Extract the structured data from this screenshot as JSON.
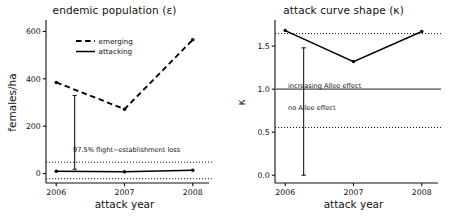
{
  "figure": {
    "panels": [
      {
        "id": "endemic-population",
        "title": "endemic population (ε)",
        "xlabel": "attack year",
        "ylabel": "females/ha"
      },
      {
        "id": "attack-curve-shape",
        "title": "attack curve shape (κ)",
        "xlabel": "attack year",
        "ylabel": "κ"
      }
    ]
  },
  "chart_data": [
    {
      "type": "line",
      "id": "endemic-population",
      "title": "endemic population (ε)",
      "xlabel": "attack year",
      "ylabel": "females/ha",
      "categories": [
        "2006",
        "2007",
        "2008"
      ],
      "x": [
        2006,
        2007,
        2008
      ],
      "xlim": [
        2005.85,
        2008.15
      ],
      "ylim": [
        -40,
        640
      ],
      "yticks": [
        0,
        200,
        400,
        600
      ],
      "yticklabels": [
        "0",
        "200",
        "400",
        "600"
      ],
      "xticks": [
        2006,
        2007,
        2008
      ],
      "xticklabels": [
        "2006",
        "2007",
        "2008"
      ],
      "grid": false,
      "legend_position": "upper-left-inside",
      "series": [
        {
          "name": "emerging",
          "style": "dashed",
          "marker": "filled-circle",
          "values": [
            385,
            272,
            565
          ]
        },
        {
          "name": "attacking",
          "style": "solid",
          "marker": "filled-circle",
          "values": [
            10,
            7,
            14
          ]
        }
      ],
      "reference_lines": [
        {
          "name": "upper-confidence-band",
          "style": "dotted",
          "value": 48
        },
        {
          "name": "lower-confidence-band",
          "style": "dotted",
          "value": -22
        }
      ],
      "annotations": [
        {
          "name": "flight-establishment-loss",
          "text": "97.5% flight−establishment loss",
          "arrow_from": 330,
          "arrow_to": 18,
          "arrow_x": 2006.27
        }
      ]
    },
    {
      "type": "line",
      "id": "attack-curve-shape",
      "title": "attack curve shape (κ)",
      "xlabel": "attack year",
      "ylabel": "κ",
      "categories": [
        "2006",
        "2007",
        "2008"
      ],
      "x": [
        2006,
        2007,
        2008
      ],
      "xlim": [
        2005.85,
        2008.15
      ],
      "ylim": [
        -0.09,
        1.78
      ],
      "yticks": [
        0.0,
        0.5,
        1.0,
        1.5
      ],
      "yticklabels": [
        "0.0",
        "0.5",
        "1.0",
        "1.5"
      ],
      "xticks": [
        2006,
        2007,
        2008
      ],
      "xticklabels": [
        "2006",
        "2007",
        "2008"
      ],
      "grid": false,
      "legend_position": "none",
      "series": [
        {
          "name": "kappa",
          "style": "solid",
          "marker": "filled-circle",
          "values": [
            1.68,
            1.32,
            1.67
          ]
        }
      ],
      "reference_lines": [
        {
          "name": "upper-dotted-threshold",
          "style": "dotted",
          "value": 1.645
        },
        {
          "name": "allee-threshold",
          "style": "solid",
          "color": "#808080",
          "value": 1.0
        },
        {
          "name": "lower-dotted-threshold",
          "style": "dotted",
          "value": 0.555
        }
      ],
      "annotations": [
        {
          "name": "increasing-allee-effect",
          "text": "increasing Allee effect",
          "value": 1.12
        },
        {
          "name": "no-allee-effect",
          "text": "no Allee effect",
          "value": 0.87
        },
        {
          "name": "kappa-range-bar",
          "text": "",
          "arrow_from": 1.48,
          "arrow_to": 0.0,
          "arrow_x": 2006.27
        }
      ]
    }
  ],
  "colors": {
    "axis": "#111111",
    "series": "#000000",
    "reference_gray": "#808080",
    "background": "#ffffff"
  }
}
